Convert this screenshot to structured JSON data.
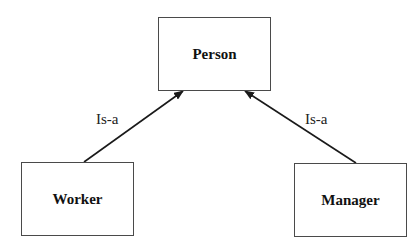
{
  "diagram": {
    "type": "class-hierarchy",
    "nodes": [
      {
        "id": "person",
        "label": "Person",
        "x": 158,
        "y": 17,
        "w": 113,
        "h": 74
      },
      {
        "id": "worker",
        "label": "Worker",
        "x": 21,
        "y": 162,
        "w": 113,
        "h": 74
      },
      {
        "id": "manager",
        "label": "Manager",
        "x": 294,
        "y": 163,
        "w": 113,
        "h": 74
      }
    ],
    "edges": [
      {
        "from": "worker",
        "to": "person",
        "label": "Is-a",
        "x1": 84,
        "y1": 162,
        "x2": 183,
        "y2": 91
      },
      {
        "from": "manager",
        "to": "person",
        "label": "Is-a",
        "x1": 356,
        "y1": 163,
        "x2": 245,
        "y2": 91
      }
    ],
    "edge_labels": [
      {
        "text": "Is-a",
        "x": 96,
        "y": 111
      },
      {
        "text": "Is-a",
        "x": 305,
        "y": 111
      }
    ],
    "colors": {
      "stroke": "#4a4a4a",
      "arrow": "#1a1a1a",
      "text": "#111111",
      "background": "#ffffff"
    }
  }
}
